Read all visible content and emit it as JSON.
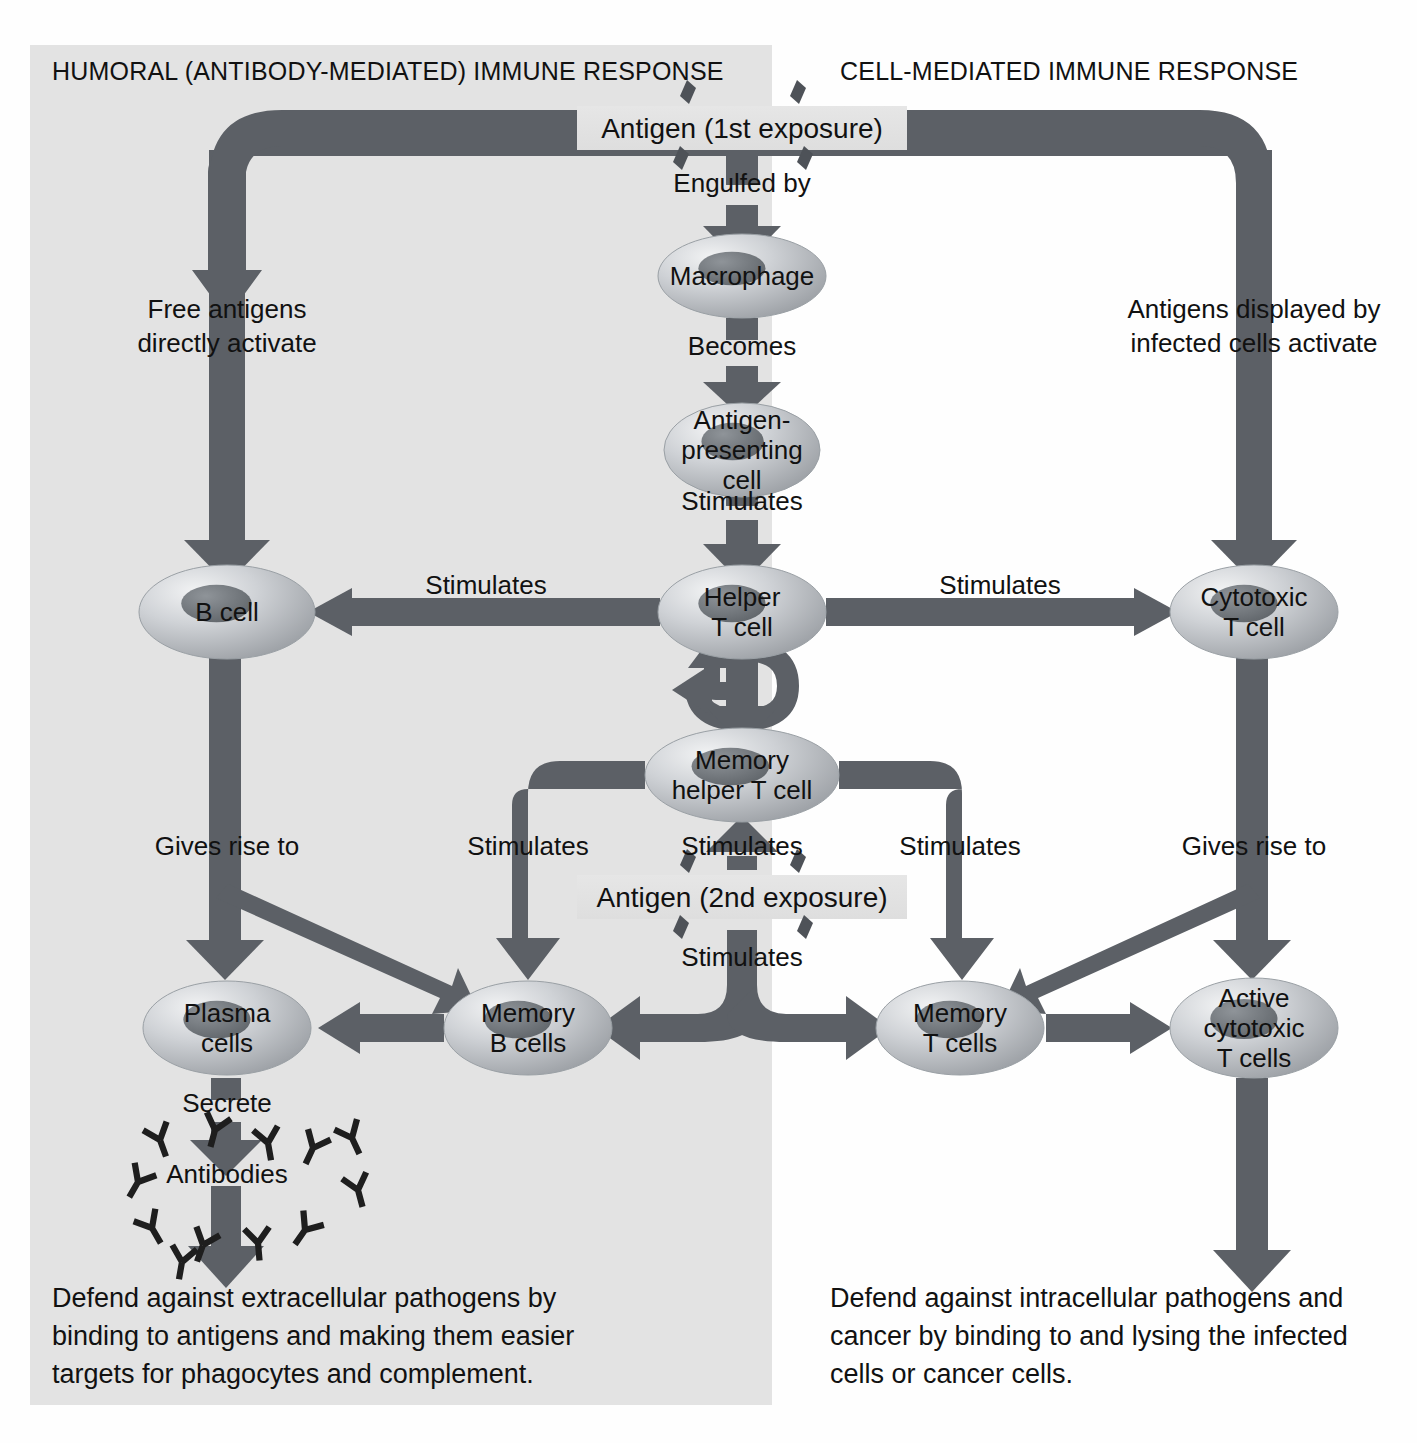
{
  "colors": {
    "panel_shade": "#e3e3e3",
    "arrow": "#5c6066",
    "arrow_dark": "#4e5258",
    "cell_fill": "#b9bcc0",
    "cell_edge": "#8e9297",
    "nucleus": "#6f7479",
    "text": "#111111",
    "antigen_band": "#e0e0e0",
    "background": "#fefefe"
  },
  "panels": {
    "humoral": {
      "title": "HUMORAL (ANTIBODY-MEDIATED) IMMUNE RESPONSE",
      "caption": "Defend against extracellular pathogens by binding to antigens and making them easier targets for phagocytes and complement.",
      "caption_lines": [
        "Defend against extracellular pathogens by",
        "binding to antigens and making them easier",
        "targets for phagocytes and complement."
      ]
    },
    "cell_mediated": {
      "title": "CELL-MEDIATED IMMUNE RESPONSE",
      "caption": "Defend against intracellular pathogens and cancer by binding to and lysing the infected cells or cancer cells.",
      "caption_lines": [
        "Defend against intracellular pathogens and",
        "cancer by binding to and lysing the infected",
        "cells or cancer cells."
      ]
    }
  },
  "antigens": [
    {
      "id": "antigen-first",
      "label": "Antigen (1st exposure)",
      "x": 742,
      "y": 128
    },
    {
      "id": "antigen-second",
      "label": "Antigen (2nd exposure)",
      "x": 742,
      "y": 897
    }
  ],
  "cells": [
    {
      "id": "macrophage",
      "lines": [
        "Macrophage"
      ],
      "cx": 742,
      "cy": 276,
      "rx": 84,
      "ry": 42
    },
    {
      "id": "antigen-presenting-cell",
      "lines": [
        "Antigen-",
        "presenting",
        "cell"
      ],
      "cx": 742,
      "cy": 450,
      "rx": 78,
      "ry": 47
    },
    {
      "id": "helper-t-cell",
      "lines": [
        "Helper",
        "T cell"
      ],
      "cx": 742,
      "cy": 612,
      "rx": 84,
      "ry": 47
    },
    {
      "id": "b-cell",
      "lines": [
        "B cell"
      ],
      "cx": 227,
      "cy": 612,
      "rx": 88,
      "ry": 47
    },
    {
      "id": "cytotoxic-t-cell",
      "lines": [
        "Cytotoxic",
        "T cell"
      ],
      "cx": 1254,
      "cy": 612,
      "rx": 84,
      "ry": 47
    },
    {
      "id": "memory-helper-t-cell",
      "lines": [
        "Memory",
        "helper T cell"
      ],
      "cx": 742,
      "cy": 775,
      "rx": 97,
      "ry": 47
    },
    {
      "id": "plasma-cells",
      "lines": [
        "Plasma",
        "cells"
      ],
      "cx": 227,
      "cy": 1028,
      "rx": 84,
      "ry": 47
    },
    {
      "id": "memory-b-cells",
      "lines": [
        "Memory",
        "B cells"
      ],
      "cx": 528,
      "cy": 1028,
      "rx": 84,
      "ry": 47
    },
    {
      "id": "memory-t-cells",
      "lines": [
        "Memory",
        "T cells"
      ],
      "cx": 960,
      "cy": 1028,
      "rx": 84,
      "ry": 47
    },
    {
      "id": "active-cytotoxic-t-cells",
      "lines": [
        "Active",
        "cytotoxic",
        "T cells"
      ],
      "cx": 1254,
      "cy": 1028,
      "rx": 84,
      "ry": 50
    }
  ],
  "arrow_labels": [
    {
      "id": "engulfed-by",
      "text": "Engulfed by",
      "x": 742,
      "y": 192,
      "anchor": "middle"
    },
    {
      "id": "becomes",
      "text": "Becomes",
      "x": 742,
      "y": 355,
      "anchor": "middle"
    },
    {
      "id": "stimulates-apc-helper",
      "text": "Stimulates",
      "x": 742,
      "y": 510,
      "anchor": "middle"
    },
    {
      "id": "free-antigens-activate-1",
      "text": "Free antigens",
      "x": 227,
      "y": 318,
      "anchor": "middle"
    },
    {
      "id": "free-antigens-activate-2",
      "text": "directly activate",
      "x": 227,
      "y": 352,
      "anchor": "middle"
    },
    {
      "id": "antigens-displayed-1",
      "text": "Antigens displayed by",
      "x": 1254,
      "y": 318,
      "anchor": "middle"
    },
    {
      "id": "antigens-displayed-2",
      "text": "infected cells activate",
      "x": 1254,
      "y": 352,
      "anchor": "middle"
    },
    {
      "id": "stimulates-helper-b",
      "text": "Stimulates",
      "x": 486,
      "y": 594,
      "anchor": "middle"
    },
    {
      "id": "stimulates-helper-cyto",
      "text": "Stimulates",
      "x": 1000,
      "y": 594,
      "anchor": "middle"
    },
    {
      "id": "gives-rise-to-left",
      "text": "Gives rise to",
      "x": 227,
      "y": 855,
      "anchor": "middle"
    },
    {
      "id": "stimulates-memb-left",
      "text": "Stimulates",
      "x": 528,
      "y": 855,
      "anchor": "middle"
    },
    {
      "id": "stimulates-memhelper-up",
      "text": "Stimulates",
      "x": 742,
      "y": 855,
      "anchor": "middle"
    },
    {
      "id": "stimulates-memt-right",
      "text": "Stimulates",
      "x": 960,
      "y": 855,
      "anchor": "middle"
    },
    {
      "id": "gives-rise-to-right",
      "text": "Gives rise to",
      "x": 1254,
      "y": 855,
      "anchor": "middle"
    },
    {
      "id": "stimulates-second-down",
      "text": "Stimulates",
      "x": 742,
      "y": 966,
      "anchor": "middle"
    },
    {
      "id": "secrete",
      "text": "Secrete",
      "x": 227,
      "y": 1112,
      "anchor": "middle"
    },
    {
      "id": "antibodies",
      "text": "Antibodies",
      "x": 227,
      "y": 1183,
      "anchor": "middle"
    }
  ],
  "antibody_glyphs": [
    {
      "x": 160,
      "y": 1140,
      "rot": -20
    },
    {
      "x": 215,
      "y": 1130,
      "rot": 15
    },
    {
      "x": 268,
      "y": 1143,
      "rot": -10
    },
    {
      "x": 313,
      "y": 1148,
      "rot": 25
    },
    {
      "x": 352,
      "y": 1138,
      "rot": -25
    },
    {
      "x": 138,
      "y": 1182,
      "rot": 30
    },
    {
      "x": 358,
      "y": 1190,
      "rot": -15
    },
    {
      "x": 152,
      "y": 1228,
      "rot": -30
    },
    {
      "x": 203,
      "y": 1245,
      "rot": 20
    },
    {
      "x": 258,
      "y": 1243,
      "rot": -5
    },
    {
      "x": 305,
      "y": 1230,
      "rot": 35
    },
    {
      "x": 182,
      "y": 1262,
      "rot": 10
    }
  ],
  "top_fragment": ""
}
